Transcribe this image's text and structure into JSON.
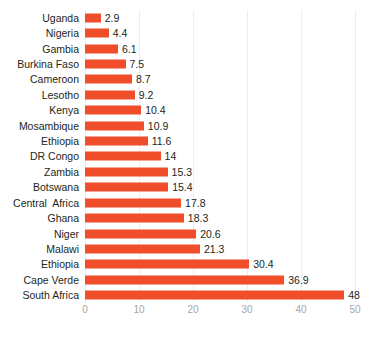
{
  "chart_data": {
    "type": "bar",
    "orientation": "horizontal",
    "title": "",
    "subtitle": "",
    "xlabel": "",
    "ylabel": "",
    "xlim": [
      0,
      50
    ],
    "xticks": [
      0,
      10,
      20,
      30,
      40,
      50
    ],
    "grid": true,
    "grid_axis": "x",
    "legend": false,
    "legend_position": "none",
    "bar_color": "#f04e2a",
    "label_color": "#231f20",
    "tick_color": "#a6a6a6",
    "gridline_color": "#ededed",
    "background_color": "#ffffff",
    "categories": [
      "Uganda",
      "Nigeria",
      "Gambia",
      "Burkina Faso",
      "Cameroon",
      "Lesotho",
      "Kenya",
      "Mosambique",
      "Ethiopia",
      "DR Congo",
      "Zambia",
      "Botswana",
      "Central  Africa",
      "Ghana",
      "Niger",
      "Malawi",
      "Ethiopia",
      "Cape Verde",
      "South Africa"
    ],
    "values": [
      2.9,
      4.4,
      6.1,
      7.5,
      8.7,
      9.2,
      10.4,
      10.9,
      11.6,
      14,
      15.3,
      15.4,
      17.8,
      18.3,
      20.6,
      21.3,
      30.4,
      36.9,
      48
    ],
    "value_labels": [
      "2.9",
      "4.4",
      "6.1",
      "7.5",
      "8.7",
      "9.2",
      "10.4",
      "10.9",
      "11.6",
      "14",
      "15.3",
      "15.4",
      "17.8",
      "18.3",
      "20.6",
      "21.3",
      "30.4",
      "36.9",
      "48"
    ],
    "tick_labels": [
      "0",
      "10",
      "20",
      "30",
      "40",
      "50"
    ]
  }
}
